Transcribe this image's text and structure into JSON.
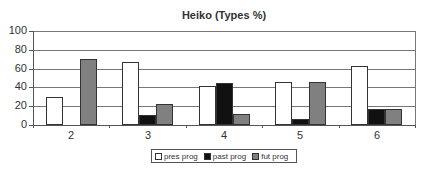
{
  "chart_data": {
    "type": "bar",
    "title": "Heiko (Types %)",
    "xlabel": "",
    "ylabel": "",
    "ylim": [
      0,
      100
    ],
    "yticks": [
      0,
      20,
      40,
      60,
      80,
      100
    ],
    "grid": true,
    "legend_position": "bottom",
    "categories": [
      "2",
      "3",
      "4",
      "5",
      "6"
    ],
    "series": [
      {
        "name": "pres prog",
        "color": "#ffffff",
        "values": [
          30,
          67,
          41,
          46,
          63
        ]
      },
      {
        "name": "past prog",
        "color": "#111111",
        "values": [
          0,
          11,
          45,
          6,
          17
        ]
      },
      {
        "name": "fut prog",
        "color": "#808080",
        "values": [
          70,
          22,
          12,
          46,
          17
        ]
      }
    ]
  },
  "labels": {
    "title": "Heiko (Types %)",
    "y": [
      "100",
      "80",
      "60",
      "40",
      "20",
      "0"
    ],
    "x": [
      "2",
      "3",
      "4",
      "5",
      "6"
    ],
    "legend": [
      "pres prog",
      "past prog",
      "fut prog"
    ]
  }
}
